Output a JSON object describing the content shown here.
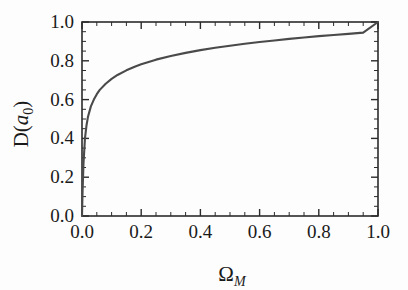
{
  "figure": {
    "background_color": "#fdfdfd",
    "frame_color": "#2b2b2b",
    "curve_color": "#4a4a4a"
  },
  "chart_data": {
    "type": "line",
    "title": "",
    "xlabel": "Ω_M",
    "ylabel": "D(a_0)",
    "xlabel_base": "Ω",
    "xlabel_sub": "M",
    "ylabel_prefix": "D(",
    "ylabel_italic": "a",
    "ylabel_sub": "0",
    "ylabel_suffix": ")",
    "xlim": [
      0.0,
      1.0
    ],
    "ylim": [
      0.0,
      1.0
    ],
    "grid": false,
    "legend": "none",
    "xticks": [
      0.0,
      0.2,
      0.4,
      0.6,
      0.8,
      1.0
    ],
    "yticks": [
      0.0,
      0.2,
      0.4,
      0.6,
      0.8,
      1.0
    ],
    "xtick_labels": [
      "0.0",
      "0.2",
      "0.4",
      "0.6",
      "0.8",
      "1.0"
    ],
    "ytick_labels": [
      "0.0",
      "0.2",
      "0.4",
      "0.6",
      "0.8",
      "1.0"
    ],
    "minor_tick_step": 0.05,
    "series": [
      {
        "name": "D(a0) vs Omega_M",
        "x": [
          0.0,
          0.002,
          0.005,
          0.01,
          0.015,
          0.02,
          0.03,
          0.04,
          0.05,
          0.06,
          0.08,
          0.1,
          0.12,
          0.15,
          0.18,
          0.2,
          0.25,
          0.3,
          0.35,
          0.4,
          0.45,
          0.5,
          0.55,
          0.6,
          0.65,
          0.7,
          0.75,
          0.8,
          0.85,
          0.9,
          0.95,
          1.0
        ],
        "y": [
          0.0,
          0.13,
          0.27,
          0.4,
          0.465,
          0.51,
          0.565,
          0.6,
          0.628,
          0.65,
          0.682,
          0.707,
          0.727,
          0.751,
          0.771,
          0.782,
          0.806,
          0.825,
          0.841,
          0.855,
          0.867,
          0.878,
          0.888,
          0.897,
          0.905,
          0.913,
          0.92,
          0.927,
          0.933,
          0.939,
          0.945,
          1.0
        ]
      }
    ]
  }
}
